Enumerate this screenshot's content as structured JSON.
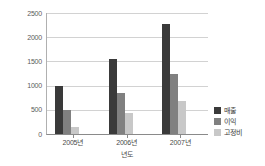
{
  "chart_data": {
    "type": "bar",
    "title": "",
    "xlabel": "년도",
    "ylabel": "",
    "categories": [
      "2005년",
      "2006년",
      "2007년"
    ],
    "series": [
      {
        "name": "매출",
        "color": "#3a3a3a",
        "values": [
          1000,
          1560,
          2280
        ]
      },
      {
        "name": "이익",
        "color": "#808080",
        "values": [
          500,
          850,
          1250
        ]
      },
      {
        "name": "고정비",
        "color": "#c8c8c8",
        "values": [
          150,
          430,
          690
        ]
      }
    ],
    "ylim": [
      0,
      2500
    ],
    "yticks": [
      0,
      500,
      1000,
      1500,
      2000,
      2500
    ],
    "ytick_labels": [
      "0",
      "500",
      "1000",
      "1500",
      "2000",
      "2500"
    ],
    "grid": true,
    "legend_position": "right"
  }
}
